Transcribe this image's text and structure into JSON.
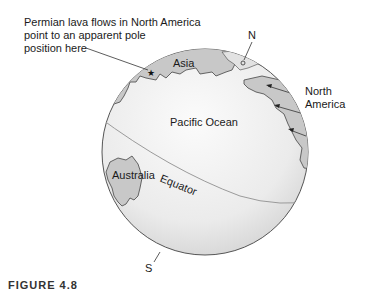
{
  "figure": {
    "callout": [
      "Permian lava flows in North America",
      "point to an apparent pole",
      "position here"
    ],
    "labels": {
      "north_pole": "N",
      "south_pole": "S",
      "asia": "Asia",
      "north_america_line1": "North",
      "north_america_line2": "America",
      "pacific": "Pacific Ocean",
      "australia": "Australia",
      "equator": "Equator"
    },
    "caption": "FIGURE 4.8"
  },
  "colors": {
    "ocean_light": "#f4f4f4",
    "ocean_shade": "#d6d6d6",
    "land": "#c8c8c8",
    "outline": "#555555",
    "equator": "#9a9a9a"
  }
}
